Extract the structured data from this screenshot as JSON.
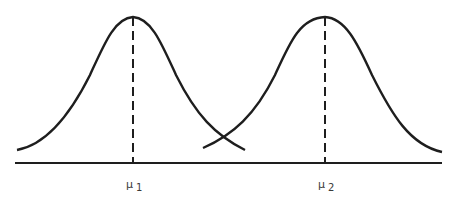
{
  "diagram": {
    "type": "two-normal-distributions",
    "curves": [
      {
        "name": "distribution-1",
        "mean_label": "μ",
        "mean_subscript": "1",
        "peak_x": 133
      },
      {
        "name": "distribution-2",
        "mean_label": "μ",
        "mean_subscript": "2",
        "peak_x": 325
      }
    ],
    "colors": {
      "line": "#1e1e1e",
      "background": "#ffffff"
    }
  }
}
